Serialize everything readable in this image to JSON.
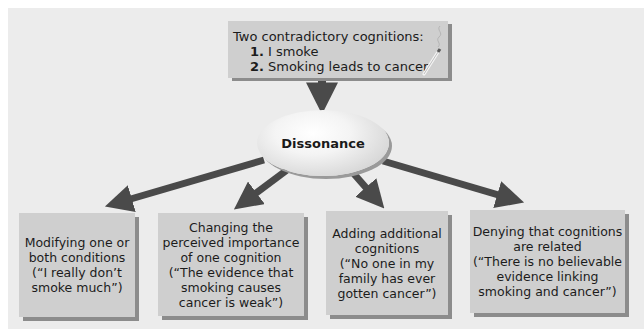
{
  "diagram": {
    "top_box": {
      "title": "Two contradictory cognitions:",
      "items": [
        {
          "number": "1.",
          "text": "I smoke"
        },
        {
          "number": "2.",
          "text": "Smoking leads to cancer"
        }
      ],
      "icon": "cigarette-icon"
    },
    "center": {
      "label": "Dissonance"
    },
    "outcomes": [
      {
        "lines": [
          "Modifying one or",
          "both conditions",
          "(“I really don’t",
          "smoke much”)"
        ]
      },
      {
        "lines": [
          "Changing the",
          "perceived importance",
          "of one cognition",
          "(“The evidence that",
          "smoking causes",
          "cancer is weak”)"
        ]
      },
      {
        "lines": [
          "Adding additional",
          "cognitions",
          "(“No one in my",
          "family has ever",
          "gotten cancer”)"
        ]
      },
      {
        "lines": [
          "Denying that cognitions",
          "are related",
          "(“There is no believable",
          "evidence linking",
          "smoking and cancer”)"
        ]
      }
    ],
    "colors": {
      "panel_bg": "#ececec",
      "box_fill": "#cfcfcf",
      "box_shadow": "#8c8c8c",
      "arrow": "#4a4a4a",
      "text": "#1c1c1c"
    }
  }
}
